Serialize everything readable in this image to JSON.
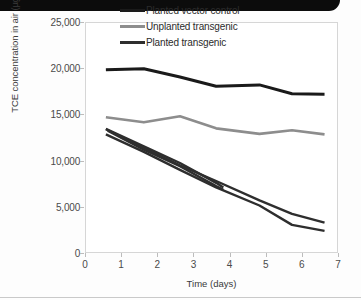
{
  "figure": {
    "banner_color": "#0c0c0c",
    "background": "#fdfdfd"
  },
  "chart_data": {
    "type": "line",
    "title": "",
    "xlabel": "Time (days)",
    "ylabel": "TCE concentration in air (µg/m3)",
    "xlim": [
      0,
      7
    ],
    "ylim": [
      0,
      25000
    ],
    "xticks": [
      0,
      1,
      2,
      3,
      4,
      5,
      6,
      7
    ],
    "yticks": [
      0,
      5000,
      10000,
      15000,
      20000,
      25000
    ],
    "xtick_labels": [
      "0",
      "1",
      "2",
      "3",
      "4",
      "5",
      "6",
      "7"
    ],
    "ytick_labels": [
      "0",
      "5,000",
      "10,000",
      "15,000",
      "20,000",
      "25,000"
    ],
    "grid": false,
    "legend_position": "top-right",
    "legend": [
      {
        "label": "Planted vector control",
        "color": "#1a1a1a"
      },
      {
        "label": "Unplanted transgenic",
        "color": "#8d8d8d"
      },
      {
        "label": "Planted transgenic",
        "color": "#2e2e2e"
      }
    ],
    "series": [
      {
        "name": "Planted vector control",
        "color": "#1a1a1a",
        "width": 3.0,
        "x": [
          0.55,
          1.6,
          2.6,
          3.6,
          4.8,
          5.7,
          6.6
        ],
        "values": [
          19950,
          20050,
          19150,
          18150,
          18300,
          17350,
          17300
        ]
      },
      {
        "name": "Unplanted transgenic",
        "color": "#8d8d8d",
        "width": 2.6,
        "x": [
          0.55,
          1.6,
          2.6,
          3.6,
          4.8,
          5.7,
          6.6
        ],
        "values": [
          14800,
          14250,
          14900,
          13600,
          13000,
          13400,
          12950
        ]
      },
      {
        "name": "Planted transgenic (replicate 1)",
        "color": "#2e2e2e",
        "width": 2.4,
        "x": [
          0.55,
          1.6,
          2.6,
          3.6,
          3.8
        ],
        "values": [
          13550,
          11650,
          9850,
          7700,
          7200
        ]
      },
      {
        "name": "Planted transgenic (replicate 2)",
        "color": "#2e2e2e",
        "width": 2.4,
        "x": [
          0.6,
          1.6,
          2.6,
          3.6,
          3.8
        ],
        "values": [
          13350,
          11300,
          9500,
          7350,
          6950
        ]
      },
      {
        "name": "Planted transgenic (replicate 3)",
        "color": "#2e2e2e",
        "width": 2.4,
        "x": [
          0.55,
          1.6,
          2.6,
          3.6,
          4.8,
          5.7,
          6.6
        ],
        "values": [
          13500,
          11500,
          9600,
          7900,
          5800,
          4350,
          3400
        ]
      },
      {
        "name": "Planted transgenic (replicate 4)",
        "color": "#2e2e2e",
        "width": 2.4,
        "x": [
          0.55,
          1.6,
          2.6,
          3.6,
          4.8,
          5.7,
          6.6
        ],
        "values": [
          12950,
          11050,
          9100,
          7200,
          5250,
          3150,
          2500
        ]
      }
    ]
  }
}
